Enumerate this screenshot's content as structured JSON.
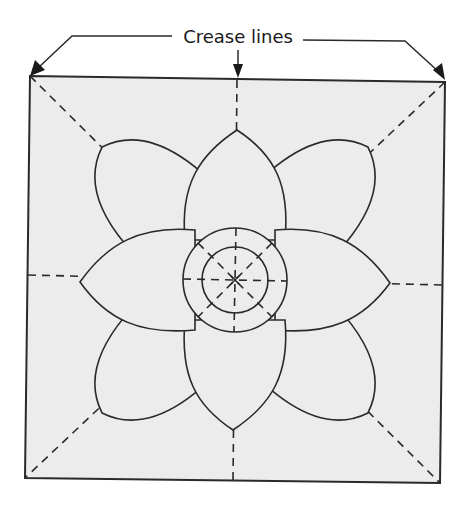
{
  "diagram": {
    "label": "Crease lines",
    "colors": {
      "paper": "#ececec",
      "ink": "#2a2a2a",
      "background": "#ffffff"
    },
    "square": {
      "corners": [
        [
          30,
          76
        ],
        [
          445,
          82
        ],
        [
          440,
          483
        ],
        [
          25,
          478
        ]
      ]
    },
    "center": [
      235,
      280
    ],
    "circles": [
      {
        "name": "outer-ring",
        "r": 52
      },
      {
        "name": "inner-ring",
        "r": 33
      }
    ],
    "petal_tips": [
      {
        "name": "top",
        "x": 237,
        "y": 130
      },
      {
        "name": "top-right",
        "x": 373,
        "y": 150
      },
      {
        "name": "right",
        "x": 390,
        "y": 283
      },
      {
        "name": "bottom-right",
        "x": 368,
        "y": 415
      },
      {
        "name": "bottom",
        "x": 233,
        "y": 430
      },
      {
        "name": "bottom-left",
        "x": 95,
        "y": 408
      },
      {
        "name": "left",
        "x": 80,
        "y": 278
      },
      {
        "name": "top-left",
        "x": 100,
        "y": 145
      }
    ],
    "crease_lines": [
      "vertical",
      "horizontal",
      "diagonal-tl-br",
      "diagonal-tr-bl"
    ],
    "arrows": [
      "top-left-corner",
      "top-center",
      "top-right-corner"
    ]
  }
}
